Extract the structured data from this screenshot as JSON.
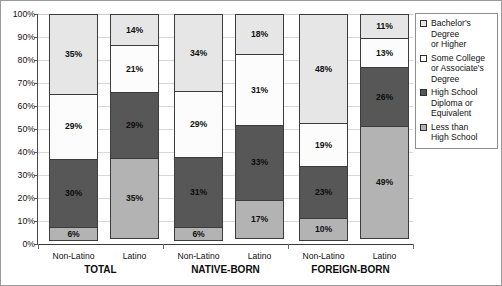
{
  "chart_data": {
    "type": "bar",
    "subtype": "stacked-percent",
    "title": "",
    "xlabel": "",
    "ylabel": "",
    "ylim": [
      0,
      100
    ],
    "ytick_labels": [
      "100%",
      "90%",
      "80%",
      "70%",
      "60%",
      "50%",
      "40%",
      "30%",
      "20%",
      "10%",
      "0%"
    ],
    "ytick_values": [
      100,
      90,
      80,
      70,
      60,
      50,
      40,
      30,
      20,
      10,
      0
    ],
    "grid": true,
    "legend_position": "right",
    "stack_order_bottom_to_top": [
      "Less than High School",
      "High School Diploma or Equivalent",
      "Some College or Associate's Degree",
      "Bachelor's Degree or Higher"
    ],
    "categories": [
      "Non-Latino",
      "Latino",
      "Non-Latino",
      "Latino",
      "Non-Latino",
      "Latino"
    ],
    "groups": [
      {
        "label": "TOTAL",
        "bars": [
          "Non-Latino",
          "Latino"
        ]
      },
      {
        "label": "NATIVE-BORN",
        "bars": [
          "Non-Latino",
          "Latino"
        ]
      },
      {
        "label": "FOREIGN-BORN",
        "bars": [
          "Non-Latino",
          "Latino"
        ]
      }
    ],
    "series": [
      {
        "name": "Less than High School",
        "color": "#b3b3b3",
        "values": [
          6,
          35,
          6,
          17,
          10,
          49
        ]
      },
      {
        "name": "High School Diploma or Equivalent",
        "color": "#575757",
        "values": [
          30,
          29,
          31,
          33,
          23,
          26
        ]
      },
      {
        "name": "Some College or Associate's Degree",
        "color": "#fcfcfc",
        "values": [
          29,
          21,
          29,
          31,
          19,
          13
        ]
      },
      {
        "name": "Bachelor's Degree or Higher",
        "color": "#e6e6e6",
        "values": [
          35,
          14,
          34,
          18,
          48,
          11
        ]
      }
    ],
    "bars": [
      {
        "group": "TOTAL",
        "category": "Non-Latino",
        "segments": [
          {
            "series": "Bachelor's Degree or Higher",
            "value": 35,
            "label": "35%",
            "color": "#e6e6e6"
          },
          {
            "series": "Some College or Associate's Degree",
            "value": 29,
            "label": "29%",
            "color": "#fcfcfc"
          },
          {
            "series": "High School Diploma or Equivalent",
            "value": 30,
            "label": "30%",
            "color": "#575757"
          },
          {
            "series": "Less than High School",
            "value": 6,
            "label": "6%",
            "color": "#b3b3b3"
          }
        ]
      },
      {
        "group": "TOTAL",
        "category": "Latino",
        "segments": [
          {
            "series": "Bachelor's Degree or Higher",
            "value": 14,
            "label": "14%",
            "color": "#e6e6e6"
          },
          {
            "series": "Some College or Associate's Degree",
            "value": 21,
            "label": "21%",
            "color": "#fcfcfc"
          },
          {
            "series": "High School Diploma or Equivalent",
            "value": 29,
            "label": "29%",
            "color": "#575757"
          },
          {
            "series": "Less than High School",
            "value": 35,
            "label": "35%",
            "color": "#b3b3b3"
          }
        ]
      },
      {
        "group": "NATIVE-BORN",
        "category": "Non-Latino",
        "segments": [
          {
            "series": "Bachelor's Degree or Higher",
            "value": 34,
            "label": "34%",
            "color": "#e6e6e6"
          },
          {
            "series": "Some College or Associate's Degree",
            "value": 29,
            "label": "29%",
            "color": "#fcfcfc"
          },
          {
            "series": "High School Diploma or Equivalent",
            "value": 31,
            "label": "31%",
            "color": "#575757"
          },
          {
            "series": "Less than High School",
            "value": 6,
            "label": "6%",
            "color": "#b3b3b3"
          }
        ]
      },
      {
        "group": "NATIVE-BORN",
        "category": "Latino",
        "segments": [
          {
            "series": "Bachelor's Degree or Higher",
            "value": 18,
            "label": "18%",
            "color": "#e6e6e6"
          },
          {
            "series": "Some College or Associate's Degree",
            "value": 31,
            "label": "31%",
            "color": "#fcfcfc"
          },
          {
            "series": "High School Diploma or Equivalent",
            "value": 33,
            "label": "33%",
            "color": "#575757"
          },
          {
            "series": "Less than High School",
            "value": 17,
            "label": "17%",
            "color": "#b3b3b3"
          }
        ]
      },
      {
        "group": "FOREIGN-BORN",
        "category": "Non-Latino",
        "segments": [
          {
            "series": "Bachelor's Degree or Higher",
            "value": 48,
            "label": "48%",
            "color": "#e6e6e6"
          },
          {
            "series": "Some College or Associate's Degree",
            "value": 19,
            "label": "19%",
            "color": "#fcfcfc"
          },
          {
            "series": "High School Diploma or Equivalent",
            "value": 23,
            "label": "23%",
            "color": "#575757"
          },
          {
            "series": "Less than High School",
            "value": 10,
            "label": "10%",
            "color": "#b3b3b3"
          }
        ]
      },
      {
        "group": "FOREIGN-BORN",
        "category": "Latino",
        "segments": [
          {
            "series": "Bachelor's Degree or Higher",
            "value": 11,
            "label": "11%",
            "color": "#e6e6e6"
          },
          {
            "series": "Some College or Associate's Degree",
            "value": 13,
            "label": "13%",
            "color": "#fcfcfc"
          },
          {
            "series": "High School Diploma or Equivalent",
            "value": 26,
            "label": "26%",
            "color": "#575757"
          },
          {
            "series": "Less than High School",
            "value": 49,
            "label": "49%",
            "color": "#b3b3b3"
          }
        ]
      }
    ],
    "legend": [
      {
        "label": "Bachelor's\nDegree\nor Higher",
        "color": "#e6e6e6"
      },
      {
        "label": "Some College\nor Associate's\nDegree",
        "color": "#fcfcfc"
      },
      {
        "label": "High School\nDiploma or\nEquivalent",
        "color": "#575757"
      },
      {
        "label": "Less than\nHigh School",
        "color": "#b3b3b3"
      }
    ]
  }
}
